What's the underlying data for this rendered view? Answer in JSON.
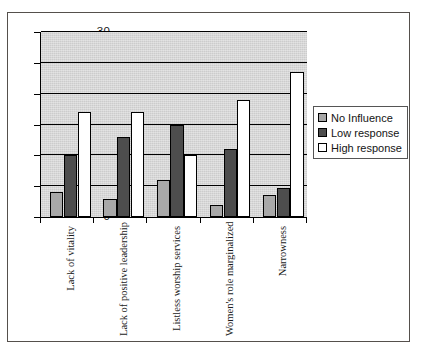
{
  "chart_data": {
    "type": "bar",
    "title": "",
    "subtitle": "",
    "xlabel": "",
    "ylabel": "",
    "ylim": [
      0,
      30
    ],
    "ytick_step": 5,
    "yticks": [
      "0",
      "5",
      "10",
      "15",
      "20",
      "25",
      "30"
    ],
    "grid": true,
    "legend_position": "right",
    "categories": [
      "Lack of vitality",
      "Lack of positive leadership",
      "Listless worship services",
      "Women's role marginalized",
      "Narrowness"
    ],
    "series": [
      {
        "name": "No Influence",
        "color": "#a8a8a8",
        "values": [
          4,
          3,
          6,
          2,
          3.5
        ]
      },
      {
        "name": "Low response",
        "color": "#4d4d4d",
        "values": [
          10,
          13,
          15,
          11,
          4.7
        ]
      },
      {
        "name": "High response",
        "color": "#ffffff",
        "values": [
          17,
          17,
          10,
          19,
          23.5
        ]
      }
    ]
  },
  "legend": {
    "items": [
      {
        "label": "No Influence"
      },
      {
        "label": "Low response"
      },
      {
        "label": "High response"
      }
    ]
  },
  "colors": {
    "plot_background": "#cccccc",
    "gridline": "#000000",
    "frame": "#55504c",
    "page_background": "#ffffff"
  }
}
